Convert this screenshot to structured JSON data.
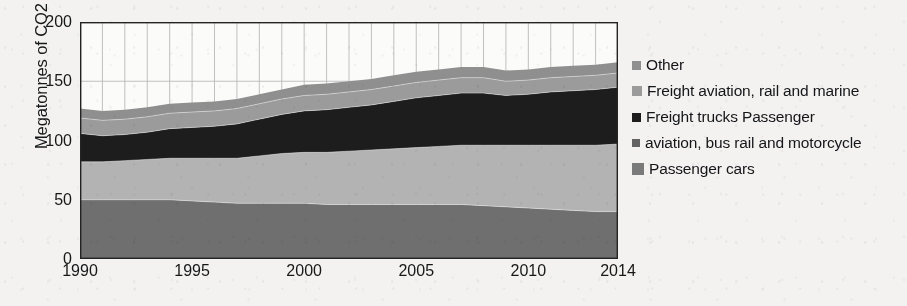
{
  "chart_data": {
    "type": "area",
    "stacked": true,
    "title": "",
    "xlabel": "",
    "ylabel": "Megatonnes of CO2 equivilent",
    "xlim": [
      1990,
      2014
    ],
    "ylim": [
      0,
      200
    ],
    "ytick_values": [
      0,
      50,
      100,
      150,
      200
    ],
    "ytick_labels": [
      "0",
      "50",
      "100",
      "150",
      "200"
    ],
    "xtick_values": [
      1990,
      1995,
      2000,
      2005,
      2010,
      2014
    ],
    "xtick_labels": [
      "1990",
      "1995",
      "2000",
      "2005",
      "2010",
      "2014"
    ],
    "grid": "vertical-yearly-and-horizontal-ticks",
    "legend_position": "right",
    "x": [
      1990,
      1991,
      1992,
      1993,
      1994,
      1995,
      1996,
      1997,
      1998,
      1999,
      2000,
      2001,
      2002,
      2003,
      2004,
      2005,
      2006,
      2007,
      2008,
      2009,
      2010,
      2011,
      2012,
      2013,
      2014
    ],
    "series": [
      {
        "name": "Passenger cars",
        "color": "#6f6f6f",
        "values": [
          50,
          50,
          50,
          50,
          50,
          49,
          48,
          47,
          47,
          47,
          47,
          46,
          46,
          46,
          46,
          46,
          46,
          46,
          45,
          44,
          43,
          42,
          41,
          40,
          40
        ]
      },
      {
        "name": "aviation, bus rail and motorcycle",
        "color": "#b3b3b3",
        "values": [
          32,
          32,
          33,
          34,
          35,
          36,
          37,
          38,
          40,
          42,
          43,
          44,
          45,
          46,
          47,
          48,
          49,
          50,
          51,
          52,
          53,
          54,
          55,
          56,
          57
        ]
      },
      {
        "name": "Freight trucks Passenger",
        "color": "#1d1d1d",
        "values": [
          24,
          22,
          22,
          23,
          25,
          26,
          27,
          29,
          31,
          33,
          35,
          36,
          37,
          38,
          40,
          42,
          43,
          44,
          44,
          42,
          43,
          45,
          46,
          47,
          48
        ]
      },
      {
        "name": "Freight aviation, rail and marine",
        "color": "#9b9b9b",
        "values": [
          13,
          13,
          13,
          13,
          13,
          13,
          13,
          13,
          13,
          13,
          13,
          13,
          13,
          13,
          13,
          13,
          13,
          13,
          13,
          12,
          12,
          12,
          12,
          12,
          12
        ]
      },
      {
        "name": "Other",
        "color": "#8f8f8f",
        "values": [
          8,
          8,
          8,
          8,
          8,
          8,
          8,
          8,
          8,
          8,
          9,
          9,
          9,
          9,
          9,
          9,
          9,
          9,
          9,
          9,
          9,
          9,
          9,
          9,
          9
        ]
      }
    ],
    "totals": [
      127,
      125,
      126,
      128,
      131,
      132,
      133,
      135,
      139,
      143,
      147,
      148,
      150,
      152,
      155,
      158,
      160,
      162,
      162,
      159,
      160,
      162,
      163,
      164,
      166
    ]
  },
  "legend": {
    "entries": [
      {
        "label": "Other",
        "color": "#8f8f8f",
        "swatch_size": 9
      },
      {
        "label": "Freight aviation, rail and marine",
        "color": "#9b9b9b",
        "swatch_size": 10
      },
      {
        "label": "Freight trucks Passenger",
        "color": "#1d1d1d",
        "swatch_size": 9
      },
      {
        "label": "aviation, bus rail and motorcycle",
        "color": "#636363",
        "swatch_size": 8
      },
      {
        "label": "Passenger cars",
        "color": "#7a7a7a",
        "swatch_size": 12
      }
    ]
  },
  "colors": {
    "background": "#f3f2f0",
    "plot_background": "#fbfbfa",
    "axis": "#232323",
    "gridline": "#b9b9b9",
    "text": "#17181a"
  }
}
